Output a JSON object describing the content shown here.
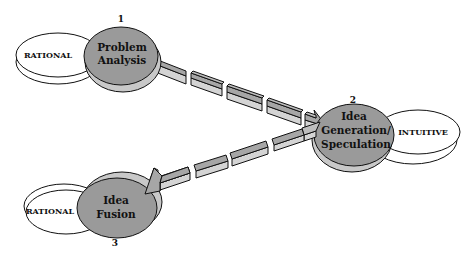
{
  "diagram": {
    "stages": [
      {
        "number": "1",
        "title_line1": "Problem",
        "title_line2": "Analysis",
        "mode": "RATIONAL"
      },
      {
        "number": "2",
        "title_line1": "Idea",
        "title_line2": "Generation/",
        "title_line3": "Speculation",
        "mode": "INTUITIVE"
      },
      {
        "number": "3",
        "title_line1": "Idea",
        "title_line2": "Fusion",
        "mode": "RATIONAL"
      }
    ],
    "colors": {
      "stage_fill": "#9a9a9a",
      "stage_shadow": "#c8c8c8",
      "arrow_fill": "#a6a6a6",
      "arrow_side": "#d4d4d4",
      "outline": "#111111",
      "mode_fill": "#ffffff"
    }
  }
}
